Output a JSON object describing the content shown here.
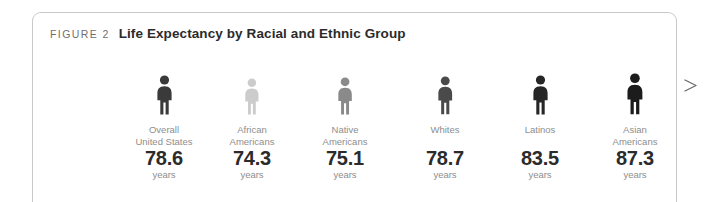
{
  "caption": {
    "eyebrow": "FIGURE 2",
    "title": "Life Expectancy by Racial and Ethnic Group"
  },
  "units_label": "years",
  "arrow": {
    "name": "increasing-arrow",
    "direction": "right"
  },
  "chart_data": {
    "type": "bar",
    "title": "Life Expectancy by Racial and Ethnic Group",
    "xlabel": "",
    "ylabel": "years",
    "categories": [
      "Overall United States",
      "African Americans",
      "Native Americans",
      "Whites",
      "Latinos",
      "Asian Americans"
    ],
    "values": [
      78.6,
      74.3,
      75.1,
      78.7,
      83.5,
      87.3
    ],
    "items": [
      {
        "label_lines": [
          "Overall",
          "United States"
        ],
        "value": "78.6",
        "units": "years",
        "icon": "person-icon",
        "icon_color": "#3a3a3a",
        "icon_scale": 1.0,
        "center_x": 131
      },
      {
        "label_lines": [
          "African",
          "Americans"
        ],
        "value": "74.3",
        "units": "years",
        "icon": "person-icon",
        "icon_color": "#cccccc",
        "icon_scale": 0.93,
        "center_x": 219
      },
      {
        "label_lines": [
          "Native",
          "Americans"
        ],
        "value": "75.1",
        "units": "years",
        "icon": "person-icon",
        "icon_color": "#8a8a8a",
        "icon_scale": 0.95,
        "center_x": 312
      },
      {
        "label_lines": [
          "Whites"
        ],
        "value": "78.7",
        "units": "years",
        "icon": "person-icon",
        "icon_color": "#4a4a4a",
        "icon_scale": 0.97,
        "center_x": 412
      },
      {
        "label_lines": [
          "Latinos"
        ],
        "value": "83.5",
        "units": "years",
        "icon": "person-icon",
        "icon_color": "#262626",
        "icon_scale": 1.0,
        "center_x": 507
      },
      {
        "label_lines": [
          "Asian",
          "Americans"
        ],
        "value": "87.3",
        "units": "years",
        "icon": "person-icon",
        "icon_color": "#1c1c1c",
        "icon_scale": 1.05,
        "center_x": 602
      }
    ],
    "legend": [],
    "grid": false
  }
}
